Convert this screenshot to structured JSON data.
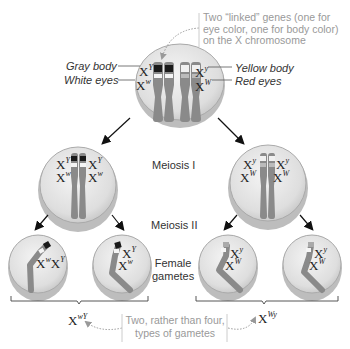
{
  "annotations": {
    "linked_genes": [
      "Two “linked” genes (one for",
      "eye color, one for body color)",
      "on the X chromosome"
    ],
    "gray_body": "Gray body",
    "white_eyes": "White eyes",
    "yellow_body": "Yellow body",
    "red_eyes": "Red eyes",
    "meiosis_1": "Meiosis I",
    "meiosis_2": "Meiosis II",
    "female_gametes": [
      "Female",
      "gametes"
    ],
    "two_types": [
      "Two, rather than four,",
      "types of gametes"
    ]
  },
  "alleles": {
    "X": "X",
    "Y_upper": "Y",
    "y_lower": "y",
    "w_lower": "w",
    "W_upper": "W",
    "gamete_left": "wY",
    "gamete_right": "Wy"
  },
  "colors": {
    "chromosome": "#8a8a8a",
    "cell_fill": "#e8e8e8",
    "band_dark": "#1a1a1a",
    "band_light": "#f5f5f5",
    "text_gray": "#9a9a9a"
  }
}
